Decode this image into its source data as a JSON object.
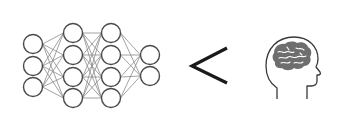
{
  "diagram": {
    "caption": "Neural network < human brain",
    "left": {
      "label": "artificial neural network",
      "layers": [
        {
          "x": 33,
          "nodes": [
            44,
            66,
            87
          ]
        },
        {
          "x": 73,
          "nodes": [
            33,
            55,
            77,
            98
          ]
        },
        {
          "x": 111,
          "nodes": [
            33,
            55,
            77,
            98
          ]
        },
        {
          "x": 150,
          "nodes": [
            55,
            76
          ]
        }
      ],
      "node_radius": 9.5,
      "node_stroke": "#4a4a4a",
      "edge_color": "#8a8a8a"
    },
    "operator": {
      "symbol": "<",
      "label": "less than",
      "color": "#1a1a1a"
    },
    "right": {
      "label": "human head with brain",
      "outline_color": "#3a3a3a",
      "brain_color": "#6e6e6e"
    }
  }
}
